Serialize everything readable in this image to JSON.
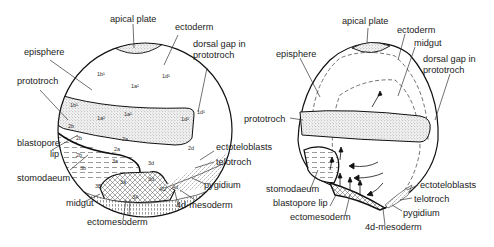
{
  "left_figure": {
    "labels": {
      "apical_plate": "apical plate",
      "ectoderm": "ectoderm",
      "episphere": "episphere",
      "dorsal_gap_1": "dorsal gap in",
      "dorsal_gap_2": "prototroch",
      "prototroch": "prototroch",
      "blastopore_1": "blastopore",
      "blastopore_2": "lip",
      "stomodaeum": "stomodaeum",
      "ectoteloblasts": "ectoteloblasts",
      "telotroch": "telotroch",
      "pygidium": "pygidium",
      "midgut": "midgut",
      "mesoderm_4d": "4d-mesoderm",
      "ectomesoderm": "ectomesoderm"
    },
    "cells": {
      "c1b1": "1b¹",
      "c1a1": "1a¹",
      "c1d1": "1d¹",
      "c1d1b": "1d¹",
      "c1b1p": "1b¹",
      "c1a2": "1a²",
      "c1a1p": "1a¹",
      "c1d2": "1d²",
      "c2b": "2b",
      "c2b2": "2b",
      "c2a": "2a",
      "c2a2": "2a",
      "c2d": "2d",
      "c2b3": "2b",
      "c3a": "3a",
      "c3b": "3b",
      "c3d": "3d",
      "c3a2": "3a",
      "c3d2": "3d",
      "c3B": "3B",
      "c3A": "3A",
      "c4D": "4D",
      "c4d": "4d"
    }
  },
  "right_figure": {
    "labels": {
      "apical_plate": "apical plate",
      "ectoderm": "ectoderm",
      "midgut": "midgut",
      "episphere": "episphere",
      "dorsal_gap_1": "dorsal gap in",
      "dorsal_gap_2": "prototroch",
      "prototroch": "prototroch",
      "stomodaeum": "stomodaeum",
      "blastopore_lip": "blastopore lip",
      "ectomesoderm": "ectomesoderm",
      "ectoteloblasts": "ectoteloblasts",
      "telotroch": "telotroch",
      "pygidium": "pygidium",
      "mesoderm_4d": "4d-mesoderm"
    }
  }
}
